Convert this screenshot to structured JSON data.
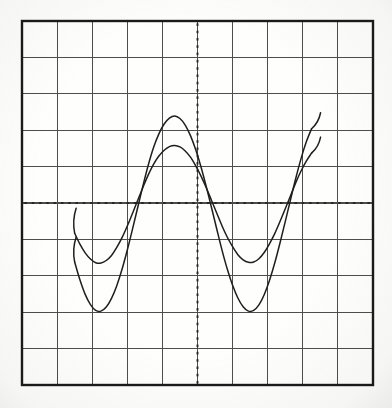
{
  "figure": {
    "kind": "oscilloscope-screen-photograph",
    "background_color": "#fdfdfc",
    "ink_color": "#1e1e1e",
    "grid_color": "#4a4a4a",
    "border_color": "#1a1a1a"
  },
  "graticule": {
    "label": "graticule",
    "x_left": 22,
    "y_top": 21,
    "x_right": 373,
    "y_bottom": 385,
    "horizontal_divisions": 10,
    "vertical_divisions": 10,
    "division_width_px": 35.1,
    "division_height_px": 36.4,
    "border_width_px": 2.4,
    "grid_line_width_px": 1.1,
    "center_axis_style": "dotted",
    "center_axis_dot_spacing_px": 7.3,
    "center_x_px": 197.5,
    "center_y_px": 203.0
  },
  "chart_data": {
    "type": "line",
    "title": "",
    "subtitle": "",
    "xlabel": "",
    "ylabel": "",
    "grid": true,
    "legend_position": "none",
    "axis_units": {
      "horizontal": "divisions",
      "vertical": "divisions"
    },
    "xlim": [
      -5,
      5
    ],
    "ylim": [
      -5,
      5
    ],
    "xticks": [
      -5,
      -4,
      -3,
      -2,
      -1,
      0,
      1,
      2,
      3,
      4,
      5
    ],
    "yticks": [
      -5,
      -4,
      -3,
      -2,
      -1,
      0,
      1,
      2,
      3,
      4,
      5
    ],
    "x_start_div": -3.5,
    "x_end_div": 3.3,
    "waveform_model": "y = offset + amplitude * -cos(2*pi*(x - x_ref)/period_div)",
    "series": [
      {
        "name": "trace-large-amplitude",
        "amplitude_div": 2.47,
        "offset_div": -0.5,
        "period_div": 4.28,
        "phase_min_at_div": 0.0,
        "peak_div": 1.97,
        "trough_div": -2.97,
        "peak_y_px": 131,
        "trough_y_px": 311,
        "stroke_width_px": 1.5,
        "color": "#1e1e1e",
        "points_div": [
          [
            -3.5,
            -1.62
          ],
          [
            -3.35,
            -2.11
          ],
          [
            -3.2,
            -2.51
          ],
          [
            -3.05,
            -2.79
          ],
          [
            -2.9,
            -2.95
          ],
          [
            -2.75,
            -2.97
          ],
          [
            -2.6,
            -2.86
          ],
          [
            -2.45,
            -2.62
          ],
          [
            -2.3,
            -2.27
          ],
          [
            -2.15,
            -1.82
          ],
          [
            -2.0,
            -1.29
          ],
          [
            -1.85,
            -0.71
          ],
          [
            -1.7,
            -0.11
          ],
          [
            -1.55,
            0.49
          ],
          [
            -1.4,
            1.05
          ],
          [
            -1.25,
            1.53
          ],
          [
            -1.1,
            1.9
          ],
          [
            -0.95,
            2.17
          ],
          [
            -0.8,
            2.33
          ],
          [
            -0.65,
            2.39
          ],
          [
            -0.5,
            2.32
          ],
          [
            -0.35,
            2.14
          ],
          [
            -0.2,
            1.85
          ],
          [
            -0.05,
            1.46
          ],
          [
            0.1,
            0.99
          ],
          [
            0.25,
            0.45
          ],
          [
            0.4,
            -0.13
          ],
          [
            0.55,
            -0.72
          ],
          [
            0.7,
            -1.3
          ],
          [
            0.85,
            -1.82
          ],
          [
            1.0,
            -2.26
          ],
          [
            1.15,
            -2.61
          ],
          [
            1.3,
            -2.85
          ],
          [
            1.45,
            -2.97
          ],
          [
            1.6,
            -2.95
          ],
          [
            1.75,
            -2.8
          ],
          [
            1.9,
            -2.52
          ],
          [
            2.05,
            -2.13
          ],
          [
            2.2,
            -1.65
          ],
          [
            2.35,
            -1.1
          ],
          [
            2.5,
            -0.51
          ],
          [
            2.65,
            0.09
          ],
          [
            2.8,
            0.68
          ],
          [
            2.95,
            1.22
          ],
          [
            3.1,
            1.68
          ],
          [
            3.25,
            2.04
          ]
        ]
      },
      {
        "name": "trace-small-amplitude",
        "amplitude_div": 1.49,
        "offset_div": -0.5,
        "period_div": 4.28,
        "phase_min_at_div": 0.0,
        "peak_div": 0.99,
        "trough_div": -1.99,
        "peak_y_px": 167,
        "trough_y_px": 275,
        "stroke_width_px": 1.5,
        "color": "#1e1e1e",
        "points_div": [
          [
            -3.5,
            -0.83
          ],
          [
            -3.35,
            -1.13
          ],
          [
            -3.2,
            -1.37
          ],
          [
            -3.05,
            -1.54
          ],
          [
            -2.9,
            -1.64
          ],
          [
            -2.75,
            -1.65
          ],
          [
            -2.6,
            -1.58
          ],
          [
            -2.45,
            -1.44
          ],
          [
            -2.3,
            -1.22
          ],
          [
            -2.15,
            -0.95
          ],
          [
            -2.0,
            -0.63
          ],
          [
            -1.85,
            -0.28
          ],
          [
            -1.7,
            0.08
          ],
          [
            -1.55,
            0.44
          ],
          [
            -1.4,
            0.78
          ],
          [
            -1.25,
            1.07
          ],
          [
            -1.1,
            1.29
          ],
          [
            -0.95,
            1.45
          ],
          [
            -0.8,
            1.55
          ],
          [
            -0.65,
            1.58
          ],
          [
            -0.5,
            1.54
          ],
          [
            -0.35,
            1.43
          ],
          [
            -0.2,
            1.26
          ],
          [
            -0.05,
            1.02
          ],
          [
            0.1,
            0.74
          ],
          [
            0.25,
            0.42
          ],
          [
            0.4,
            0.07
          ],
          [
            0.55,
            -0.28
          ],
          [
            0.7,
            -0.63
          ],
          [
            0.85,
            -0.94
          ],
          [
            1.0,
            -1.2
          ],
          [
            1.15,
            -1.42
          ],
          [
            1.3,
            -1.56
          ],
          [
            1.45,
            -1.63
          ],
          [
            1.6,
            -1.62
          ],
          [
            1.75,
            -1.53
          ],
          [
            1.9,
            -1.36
          ],
          [
            2.05,
            -1.12
          ],
          [
            2.2,
            -0.84
          ],
          [
            2.35,
            -0.51
          ],
          [
            2.5,
            -0.16
          ],
          [
            2.65,
            0.2
          ],
          [
            2.8,
            0.56
          ],
          [
            2.95,
            0.88
          ],
          [
            3.1,
            1.15
          ],
          [
            3.25,
            1.37
          ]
        ]
      }
    ],
    "annotations": [
      {
        "name": "trace-start-hook-left",
        "description": "both traces begin with a short upward hook at the left edge of the sweep"
      },
      {
        "name": "trace-end-hook-right",
        "description": "both traces end with a short upward hook at the right edge of the sweep"
      }
    ]
  }
}
